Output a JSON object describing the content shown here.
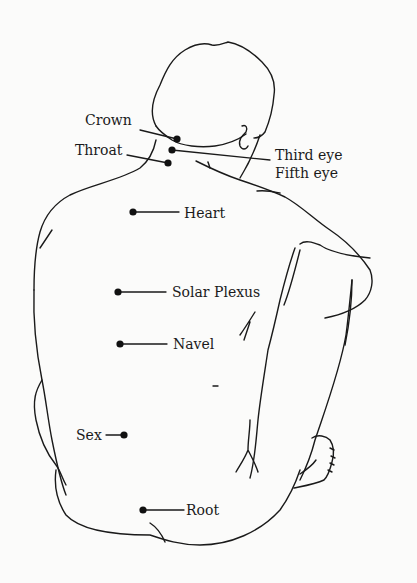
{
  "diagram": {
    "line_color": "#1a1a1a",
    "background": "#fbfbfa",
    "points": [
      {
        "id": "crown",
        "label": "Crown",
        "dot": [
          177,
          139
        ]
      },
      {
        "id": "third-eye",
        "label": "Third eye",
        "dot": [
          172,
          150
        ]
      },
      {
        "id": "fifth-eye",
        "label": "Fifth eye",
        "dot": [
          172,
          150
        ]
      },
      {
        "id": "throat",
        "label": "Throat",
        "dot": [
          168,
          163
        ]
      },
      {
        "id": "heart",
        "label": "Heart",
        "dot": [
          133,
          212
        ]
      },
      {
        "id": "solar-plexus",
        "label": "Solar Plexus",
        "dot": [
          118,
          292
        ]
      },
      {
        "id": "navel",
        "label": "Navel",
        "dot": [
          120,
          344
        ]
      },
      {
        "id": "sex",
        "label": "Sex",
        "dot": [
          124,
          435
        ]
      },
      {
        "id": "root",
        "label": "Root",
        "dot": [
          143,
          510
        ]
      }
    ]
  }
}
